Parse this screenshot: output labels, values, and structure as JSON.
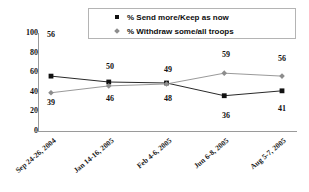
{
  "chart_data": {
    "type": "line",
    "title": "",
    "xlabel": "",
    "ylabel": "",
    "ylim": [
      0,
      100
    ],
    "ytick_labels": [
      "100",
      "80",
      "60",
      "40",
      "20",
      "0"
    ],
    "ytick_values": [
      100,
      80,
      60,
      40,
      20,
      0
    ],
    "grid": false,
    "legend_position": "top",
    "categories": [
      "Sep 24-26, 2004",
      "Jan 14-16, 2005",
      "Feb 4-6, 2005",
      "Jun 6-8, 2005",
      "Aug 5-7, 2005"
    ],
    "series": [
      {
        "name": "% Send more/Keep as now",
        "marker": "square",
        "color": "#111111",
        "values": [
          56,
          50,
          49,
          36,
          41
        ],
        "labels": [
          "56",
          "50",
          "49",
          "36",
          "41"
        ]
      },
      {
        "name": "% Withdraw some/all troops",
        "marker": "diamond",
        "color": "#8d8d8d",
        "values": [
          39,
          46,
          48,
          59,
          56
        ],
        "labels": [
          "39",
          "46",
          "48",
          "59",
          "56"
        ]
      }
    ]
  },
  "legend": {
    "items": [
      {
        "label": "% Send more/Keep as now",
        "marker": "square-marker-icon"
      },
      {
        "label": "% Withdraw some/all troops",
        "marker": "diamond-marker-icon"
      }
    ]
  },
  "value_labels": [
    {
      "text": "56",
      "x": 13,
      "y": -2
    },
    {
      "text": "39",
      "x": 13,
      "y": 66
    },
    {
      "text": "50",
      "x": 72,
      "y": 30
    },
    {
      "text": "46",
      "x": 72,
      "y": 62
    },
    {
      "text": "49",
      "x": 130,
      "y": 33
    },
    {
      "text": "48",
      "x": 130,
      "y": 62
    },
    {
      "text": "59",
      "x": 188,
      "y": 18
    },
    {
      "text": "36",
      "x": 188,
      "y": 79
    },
    {
      "text": "56",
      "x": 244,
      "y": 22
    },
    {
      "text": "41",
      "x": 244,
      "y": 72
    }
  ],
  "colors": {
    "series_1": "#111111",
    "series_2": "#8d8d8d",
    "axis": "#9a9a9a",
    "legend_border": "#b4b4b4",
    "background": "#ffffff"
  }
}
